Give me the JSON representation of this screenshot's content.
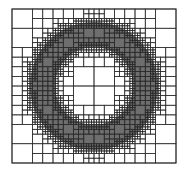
{
  "diagram": {
    "type": "quadtree-mesh",
    "domain_box": {
      "x": 12,
      "y": 9,
      "width": 164,
      "height": 154
    },
    "base_divisions": 8,
    "max_depth": 5,
    "annulus": {
      "cx": 94,
      "cy": 86,
      "outer_radius": 64,
      "inner_radius": 39
    },
    "colors": {
      "background": "#ffffff",
      "fill": "#6e6e6e",
      "line": "#2a2a2a"
    }
  }
}
